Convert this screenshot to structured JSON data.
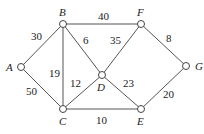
{
  "nodes": [
    {
      "id": "A",
      "x": 21,
      "y": 67,
      "lx": 6,
      "ly": 71
    },
    {
      "id": "B",
      "x": 63,
      "y": 24,
      "lx": 59,
      "ly": 16
    },
    {
      "id": "C",
      "x": 63,
      "y": 109,
      "lx": 59,
      "ly": 125
    },
    {
      "id": "D",
      "x": 102,
      "y": 75,
      "lx": 97,
      "ly": 91
    },
    {
      "id": "F",
      "x": 141,
      "y": 24,
      "lx": 137,
      "ly": 16
    },
    {
      "id": "G",
      "x": 186,
      "y": 66,
      "lx": 195,
      "ly": 70
    },
    {
      "id": "E",
      "x": 141,
      "y": 109,
      "lx": 137,
      "ly": 125
    }
  ],
  "edges": [
    {
      "from": "A",
      "to": "B",
      "weight": "30",
      "wx": 31,
      "wy": 40
    },
    {
      "from": "A",
      "to": "C",
      "weight": "50",
      "wx": 26,
      "wy": 95
    },
    {
      "from": "B",
      "to": "C",
      "weight": "19",
      "wx": 49,
      "wy": 77
    },
    {
      "from": "B",
      "to": "F",
      "weight": "40",
      "wx": 98,
      "wy": 20
    },
    {
      "from": "B",
      "to": "D",
      "weight": "6",
      "wx": 83,
      "wy": 44
    },
    {
      "from": "C",
      "to": "D",
      "weight": "12",
      "wx": 70,
      "wy": 87
    },
    {
      "from": "D",
      "to": "F",
      "weight": "35",
      "wx": 110,
      "wy": 44
    },
    {
      "from": "D",
      "to": "E",
      "weight": "23",
      "wx": 123,
      "wy": 87
    },
    {
      "from": "C",
      "to": "E",
      "weight": "10",
      "wx": 96,
      "wy": 124
    },
    {
      "from": "F",
      "to": "G",
      "weight": "8",
      "wx": 166,
      "wy": 42
    },
    {
      "from": "E",
      "to": "G",
      "weight": "20",
      "wx": 163,
      "wy": 98
    }
  ]
}
